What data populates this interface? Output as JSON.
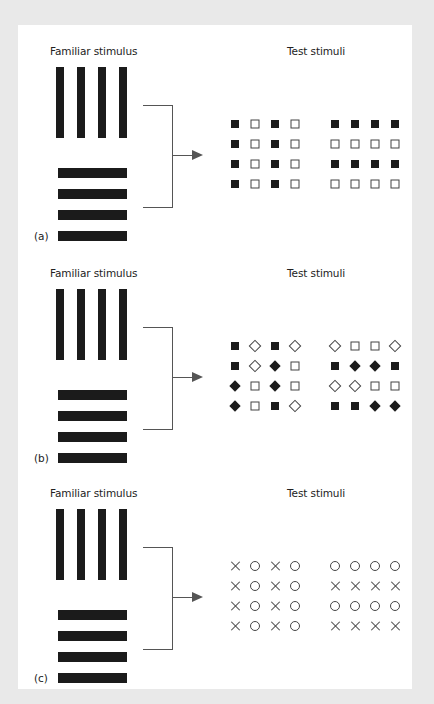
{
  "figure": {
    "panels": [
      {
        "label": "(a)",
        "familiar_title": "Familiar stimulus",
        "test_title": "Test stimuli",
        "familiar_stimuli": [
          "vertical-bars",
          "horizontal-bars"
        ],
        "test_grids": [
          {
            "name": "columns-grid",
            "cells": [
              [
                "filled-square",
                "open-square",
                "filled-square",
                "open-square"
              ],
              [
                "filled-square",
                "open-square",
                "filled-square",
                "open-square"
              ],
              [
                "filled-square",
                "open-square",
                "filled-square",
                "open-square"
              ],
              [
                "filled-square",
                "open-square",
                "filled-square",
                "open-square"
              ]
            ]
          },
          {
            "name": "rows-grid",
            "cells": [
              [
                "filled-square",
                "filled-square",
                "filled-square",
                "filled-square"
              ],
              [
                "open-square",
                "open-square",
                "open-square",
                "open-square"
              ],
              [
                "filled-square",
                "filled-square",
                "filled-square",
                "filled-square"
              ],
              [
                "open-square",
                "open-square",
                "open-square",
                "open-square"
              ]
            ]
          }
        ]
      },
      {
        "label": "(b)",
        "familiar_title": "Familiar stimulus",
        "test_title": "Test stimuli",
        "familiar_stimuli": [
          "vertical-bars",
          "horizontal-bars"
        ],
        "test_grids": [
          {
            "name": "columns-grid",
            "cells": [
              [
                "filled-square",
                "open-diamond",
                "filled-square",
                "open-diamond"
              ],
              [
                "filled-square",
                "open-diamond",
                "filled-diamond",
                "open-square"
              ],
              [
                "filled-diamond",
                "open-square",
                "filled-diamond",
                "open-square"
              ],
              [
                "filled-diamond",
                "open-square",
                "filled-square",
                "open-diamond"
              ]
            ]
          },
          {
            "name": "rows-grid",
            "cells": [
              [
                "open-diamond",
                "open-square",
                "open-square",
                "open-diamond"
              ],
              [
                "filled-square",
                "filled-diamond",
                "filled-diamond",
                "filled-square"
              ],
              [
                "open-diamond",
                "open-diamond",
                "open-square",
                "open-square"
              ],
              [
                "filled-square",
                "filled-square",
                "filled-diamond",
                "filled-diamond"
              ]
            ]
          }
        ]
      },
      {
        "label": "(c)",
        "familiar_title": "Familiar stimulus",
        "test_title": "Test stimuli",
        "familiar_stimuli": [
          "vertical-bars",
          "horizontal-bars"
        ],
        "test_grids": [
          {
            "name": "columns-grid",
            "cells": [
              [
                "cross",
                "circle",
                "cross",
                "circle"
              ],
              [
                "cross",
                "circle",
                "cross",
                "circle"
              ],
              [
                "cross",
                "circle",
                "cross",
                "circle"
              ],
              [
                "cross",
                "circle",
                "cross",
                "circle"
              ]
            ]
          },
          {
            "name": "rows-grid",
            "cells": [
              [
                "circle",
                "circle",
                "circle",
                "circle"
              ],
              [
                "cross",
                "cross",
                "cross",
                "cross"
              ],
              [
                "circle",
                "circle",
                "circle",
                "circle"
              ],
              [
                "cross",
                "cross",
                "cross",
                "cross"
              ]
            ]
          }
        ]
      }
    ],
    "colors": {
      "background": "#e9e9e9",
      "card": "#ffffff",
      "ink": "#1b1b1b",
      "line": "#555555"
    }
  }
}
